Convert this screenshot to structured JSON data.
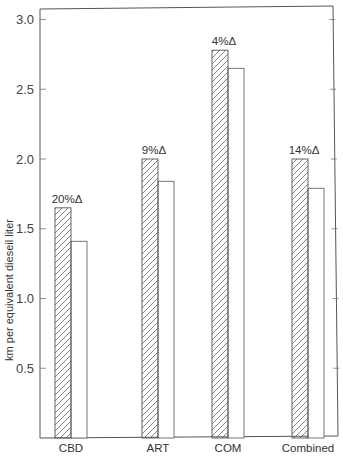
{
  "chart_data": {
    "type": "bar",
    "title": "",
    "xlabel": "",
    "ylabel": "km per equivalent dieseil liter",
    "ylim": [
      0,
      3.1
    ],
    "yticks": [
      0.5,
      1.0,
      1.5,
      2.0,
      2.5,
      3.0
    ],
    "ytick_labels": [
      "0.5",
      "1.0",
      "1.5",
      "2.0",
      "2.5",
      "3.0"
    ],
    "grid": false,
    "legend": null,
    "categories": [
      "CBD",
      "ART",
      "COM",
      "Combined"
    ],
    "series": [
      {
        "name": "hatched",
        "pattern": "diagonal-hatch",
        "values": [
          1.65,
          2.0,
          2.78,
          2.0
        ]
      },
      {
        "name": "plain",
        "pattern": "none",
        "values": [
          1.41,
          1.84,
          2.65,
          1.79
        ]
      }
    ],
    "annotations": [
      "20%Δ",
      "9%Δ",
      "4%Δ",
      "14%Δ"
    ]
  },
  "axis": {
    "ylabel": "km per equivalent dieseil liter"
  }
}
